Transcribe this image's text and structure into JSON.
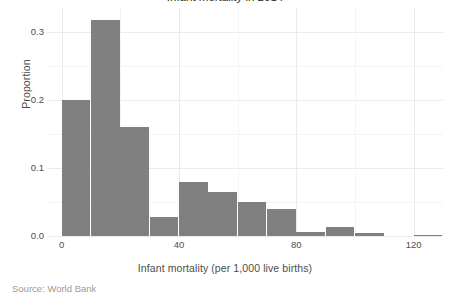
{
  "figure": {
    "title_cut_off": "Infant mortality in 2014",
    "caption_cut_off": "Source: World Bank"
  },
  "chart_data": {
    "type": "bar",
    "title": "Infant mortality in 2014",
    "xlabel": "Infant mortality (per 1,000 live births)",
    "ylabel": "Proportion",
    "grid": true,
    "legend": "none",
    "bin_width": 10,
    "xlim": [
      -5,
      130
    ],
    "ylim": [
      0.0,
      0.335
    ],
    "xticks": [
      0,
      40,
      80,
      120
    ],
    "xtick_labels": [
      "0",
      "40",
      "80",
      "120"
    ],
    "yticks": [
      0.0,
      0.1,
      0.2,
      0.3
    ],
    "ytick_labels": [
      "0.0",
      "0.1",
      "0.2",
      "0.3"
    ],
    "bar_color": "#808080",
    "panel_background": "#ffffff",
    "gridline_color": "#ebebeb",
    "categories": [
      "0-10",
      "10-20",
      "20-30",
      "30-40",
      "40-50",
      "50-60",
      "60-70",
      "70-80",
      "80-90",
      "90-100",
      "100-110",
      "110-120",
      "120-130"
    ],
    "bin_starts": [
      0,
      10,
      20,
      30,
      40,
      50,
      60,
      70,
      80,
      90,
      100,
      110,
      120
    ],
    "bin_ends": [
      10,
      20,
      30,
      40,
      50,
      60,
      70,
      80,
      90,
      100,
      110,
      120,
      130
    ],
    "values": [
      0.2,
      0.318,
      0.16,
      0.028,
      0.079,
      0.065,
      0.05,
      0.04,
      0.006,
      0.013,
      0.005,
      0.0,
      0.002
    ]
  }
}
